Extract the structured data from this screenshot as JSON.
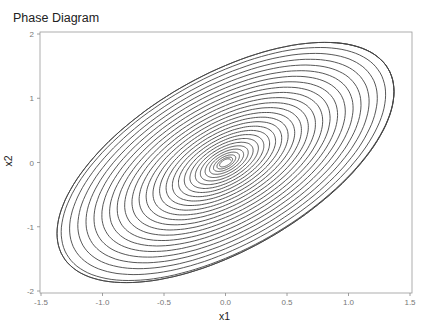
{
  "chart_data": {
    "type": "line",
    "title": "Phase Diagram",
    "xlabel": "x1",
    "ylabel": "x2",
    "xlim": [
      -1.5,
      1.5
    ],
    "ylim": [
      -2,
      2
    ],
    "xticks": [
      "-1.5",
      "-1.0",
      "-0.5",
      "0.0",
      "0.5",
      "1.0",
      "1.5"
    ],
    "yticks": [
      "-2",
      "-1",
      "0",
      "1",
      "2"
    ],
    "grid": false,
    "legend": null,
    "series": [
      {
        "name": "trajectory",
        "description": "spiral from origin growing to an elliptical limit cycle",
        "limit_cycle": {
          "x1_amplitude": 1.37,
          "x2_amplitude": 1.87,
          "phase_lag": 0.94
        },
        "extremes": [
          {
            "x1": -1.37,
            "x2": -1.17
          },
          {
            "x1": 1.37,
            "x2": 1.08
          },
          {
            "x1": 0.74,
            "x2": 1.86
          },
          {
            "x1": -0.7,
            "x2": -1.89
          }
        ],
        "turns": 26,
        "color": "#444444"
      }
    ]
  }
}
